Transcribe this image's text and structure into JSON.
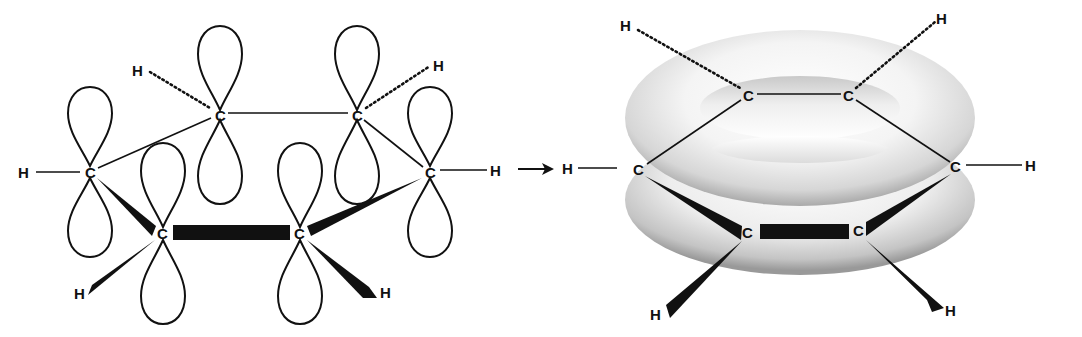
{
  "figure": {
    "left_panel": {
      "name": "p-orbital model",
      "atoms": {
        "carbon_label": "C",
        "hydrogen_label": "H"
      },
      "carbons": [
        {
          "id": "c1",
          "label": "C",
          "x": 90,
          "y": 172
        },
        {
          "id": "c2",
          "label": "C",
          "x": 220,
          "y": 115
        },
        {
          "id": "c3",
          "label": "C",
          "x": 357,
          "y": 115
        },
        {
          "id": "c4",
          "label": "C",
          "x": 430,
          "y": 172
        },
        {
          "id": "c5",
          "label": "C",
          "x": 163,
          "y": 233
        },
        {
          "id": "c6",
          "label": "C",
          "x": 300,
          "y": 233
        }
      ],
      "hydrogens": [
        {
          "id": "h1",
          "label": "H",
          "x": 25,
          "y": 172
        },
        {
          "id": "h2",
          "label": "H",
          "x": 140,
          "y": 70
        },
        {
          "id": "h3",
          "label": "H",
          "x": 440,
          "y": 66
        },
        {
          "id": "h4",
          "label": "H",
          "x": 497,
          "y": 170
        },
        {
          "id": "h5",
          "label": "H",
          "x": 82,
          "y": 293
        },
        {
          "id": "h6",
          "label": "H",
          "x": 388,
          "y": 293
        }
      ]
    },
    "arrow": {
      "label": "→",
      "direction": "right"
    },
    "right_panel": {
      "name": "delocalized pi cloud (torus) model",
      "carbons": [
        {
          "id": "c1",
          "label": "C",
          "x": 640,
          "y": 168
        },
        {
          "id": "c2",
          "label": "C",
          "x": 749,
          "y": 95
        },
        {
          "id": "c3",
          "label": "C",
          "x": 849,
          "y": 95
        },
        {
          "id": "c4",
          "label": "C",
          "x": 957,
          "y": 166
        },
        {
          "id": "c5",
          "label": "C",
          "x": 749,
          "y": 232
        },
        {
          "id": "c6",
          "label": "C",
          "x": 859,
          "y": 230
        }
      ],
      "hydrogens": [
        {
          "id": "h1",
          "label": "H",
          "x": 567,
          "y": 168
        },
        {
          "id": "h2",
          "label": "H",
          "x": 626,
          "y": 25
        },
        {
          "id": "h3",
          "label": "H",
          "x": 943,
          "y": 18
        },
        {
          "id": "h4",
          "label": "H",
          "x": 1032,
          "y": 166
        },
        {
          "id": "h5",
          "label": "H",
          "x": 656,
          "y": 314
        },
        {
          "id": "h6",
          "label": "H",
          "x": 952,
          "y": 310
        }
      ]
    },
    "colors": {
      "ink": "#111111",
      "background": "#ffffff",
      "torus_light": "#f7f7f7",
      "torus_dark": "#9a9a9a"
    }
  }
}
